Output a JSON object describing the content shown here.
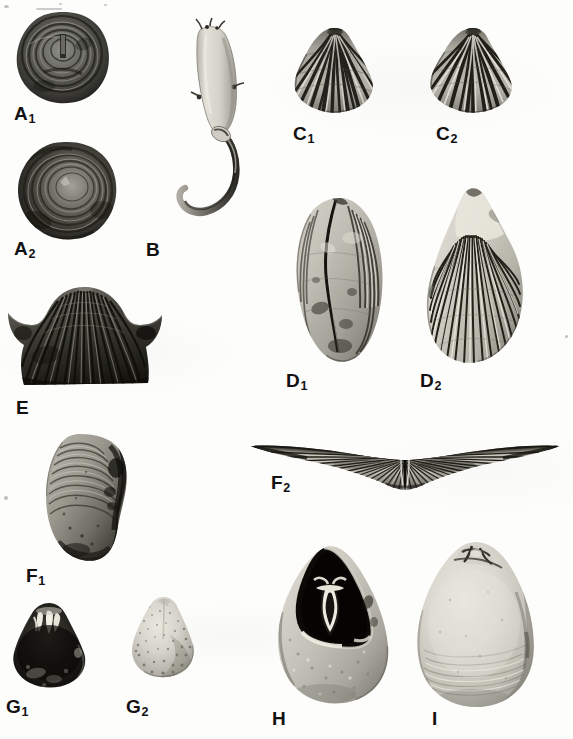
{
  "plate": {
    "kind": "paleontological-figure-plate",
    "background_color": "#fdfdfc",
    "label_color": "#111111",
    "width": 573,
    "height": 739,
    "caption": ""
  },
  "figures": [
    {
      "id": "A1",
      "label": "A",
      "sub": "1",
      "description": "Circular dark brachiopod valve, concentric growth lines, umbonal scar near centre",
      "label_x": 14,
      "label_y": 104,
      "box": {
        "x": 14,
        "y": 10,
        "w": 98,
        "h": 96
      },
      "tone": "dark"
    },
    {
      "id": "A2",
      "label": "A",
      "sub": "2",
      "description": "Circular dark brachiopod valve, opposite view, smooth convex umbo",
      "label_x": 14,
      "label_y": 239,
      "box": {
        "x": 16,
        "y": 140,
        "w": 104,
        "h": 103
      },
      "tone": "dark"
    },
    {
      "id": "B",
      "label": "B",
      "sub": "",
      "description": "Elongate pale conical shell with long curved recurved spine",
      "label_x": 146,
      "label_y": 240,
      "box": {
        "x": 176,
        "y": 18,
        "w": 78,
        "h": 200
      },
      "tone": "light"
    },
    {
      "id": "C1",
      "label": "C",
      "sub": "1",
      "description": "Coarsely ribbed triangular brachiopod, ventral valve view",
      "label_x": 293,
      "label_y": 124,
      "box": {
        "x": 292,
        "y": 26,
        "w": 86,
        "h": 88
      },
      "tone": "mid"
    },
    {
      "id": "C2",
      "label": "C",
      "sub": "2",
      "description": "Coarsely ribbed triangular brachiopod, dorsal valve view",
      "label_x": 436,
      "label_y": 124,
      "box": {
        "x": 428,
        "y": 26,
        "w": 88,
        "h": 88
      },
      "tone": "mid"
    },
    {
      "id": "D1",
      "label": "D",
      "sub": "1",
      "description": "Ovate thick-shelled brachiopod, worn lateral view with median cleft",
      "label_x": 286,
      "label_y": 371,
      "box": {
        "x": 290,
        "y": 196,
        "w": 96,
        "h": 168
      },
      "tone": "light"
    },
    {
      "id": "D2",
      "label": "D",
      "sub": "2",
      "description": "Ovate finely ribbed brachiopod, exterior view with many radial costae",
      "label_x": 420,
      "label_y": 371,
      "box": {
        "x": 420,
        "y": 186,
        "w": 108,
        "h": 180
      },
      "tone": "light"
    },
    {
      "id": "E",
      "label": "E",
      "sub": "",
      "description": "Strongly alate winged spiriferid brachiopod, anterior view with long hinge extensions",
      "label_x": 271,
      "label_y": 473,
      "box": {
        "x": 247,
        "y": 440,
        "w": 316,
        "h": 54
      },
      "tone": "mid"
    },
    {
      "id": "F1",
      "label": "F",
      "sub": "1",
      "description": "Dark winged brachiopod with radial ribs and flaring lateral extensions",
      "label_x": 16,
      "label_y": 398,
      "box": {
        "x": 6,
        "y": 285,
        "w": 158,
        "h": 102
      },
      "tone": "dark"
    },
    {
      "id": "F2",
      "label": "F",
      "sub": "2",
      "description": "Lateral view of the same brachiopod showing concentric growth lamellae",
      "label_x": 26,
      "label_y": 566,
      "box": {
        "x": 38,
        "y": 432,
        "w": 92,
        "h": 130
      },
      "tone": "mid"
    },
    {
      "id": "G1",
      "label": "G",
      "sub": "1",
      "description": "Small dark subtriangular brachiopod with pale hinge teeth visible at umbo",
      "label_x": 6,
      "label_y": 697,
      "box": {
        "x": 8,
        "y": 601,
        "w": 82,
        "h": 88
      },
      "tone": "dark"
    },
    {
      "id": "G2",
      "label": "G",
      "sub": "2",
      "description": "Small pale granular subtriangular brachiopod, exterior view",
      "label_x": 126,
      "label_y": 697,
      "box": {
        "x": 130,
        "y": 595,
        "w": 68,
        "h": 84
      },
      "tone": "light"
    },
    {
      "id": "H",
      "label": "H",
      "sub": "",
      "description": "Pale pear-shaped brachiopod broken open to expose dark interior with forked brachial support",
      "label_x": 272,
      "label_y": 709,
      "box": {
        "x": 268,
        "y": 544,
        "w": 128,
        "h": 160
      },
      "tone": "light"
    },
    {
      "id": "I",
      "label": "I",
      "sub": "",
      "description": "Pale smooth pear-shaped brachiopod, exterior view with concentric growth lines",
      "label_x": 432,
      "label_y": 709,
      "box": {
        "x": 410,
        "y": 540,
        "w": 130,
        "h": 168
      },
      "tone": "light"
    }
  ],
  "artifacts": [
    {
      "x": 4,
      "y": 6,
      "r": 2
    },
    {
      "x": 60,
      "y": 3,
      "r": 1
    },
    {
      "x": 104,
      "y": 4,
      "r": 1
    },
    {
      "x": 5,
      "y": 497,
      "r": 2
    },
    {
      "x": 566,
      "y": 336,
      "r": 1
    }
  ]
}
